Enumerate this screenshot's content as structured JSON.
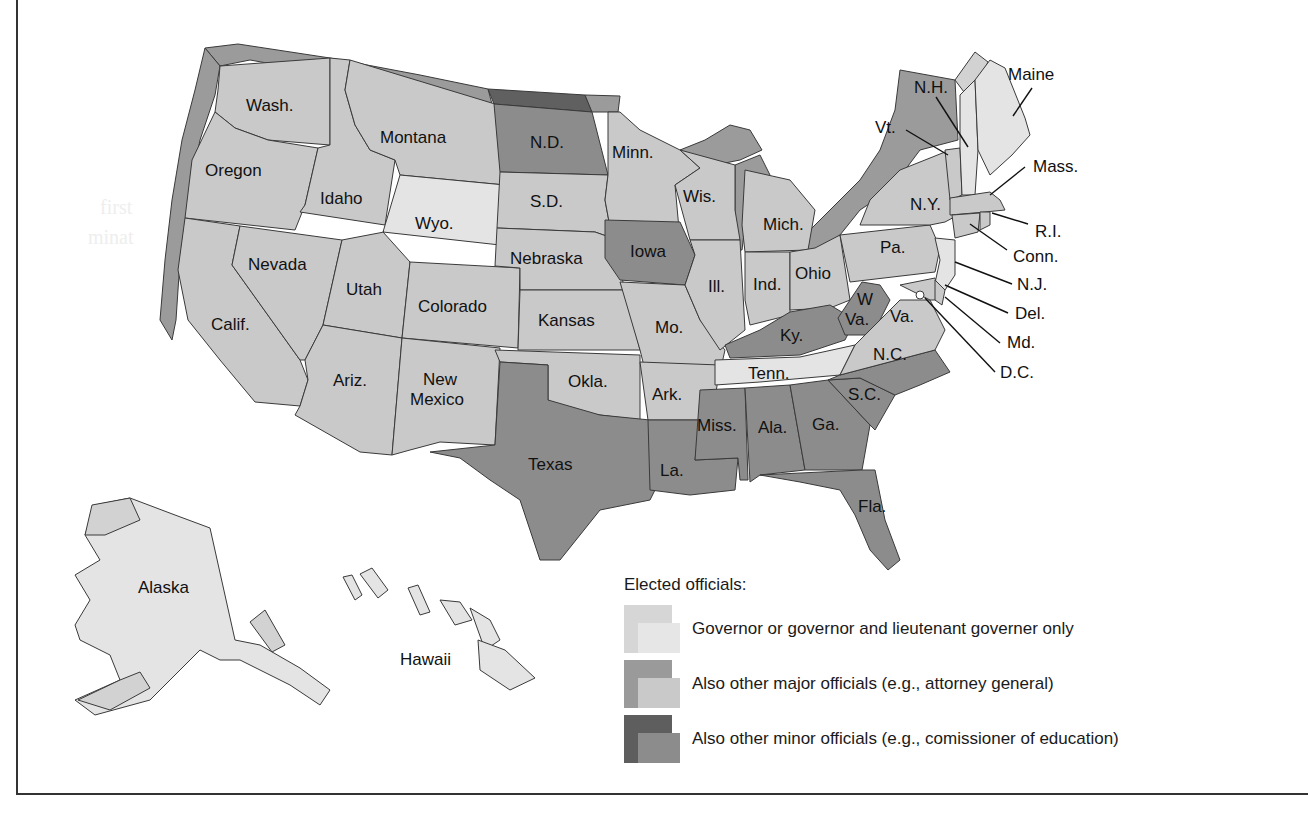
{
  "figure": {
    "colors": {
      "governor_only": "#e4e4e4",
      "major_officials": "#c9c9c9",
      "minor_officials": "#8c8c8c",
      "major_extrude": "#9b9b9b",
      "minor_extrude": "#606060",
      "frame": "#333333"
    }
  },
  "states": {
    "wash": "Wash.",
    "oregon": "Oregon",
    "calif": "Calif.",
    "nevada": "Nevada",
    "idaho": "Idaho",
    "montana": "Montana",
    "wyo": "Wyo.",
    "utah": "Utah",
    "colorado": "Colorado",
    "ariz": "Ariz.",
    "new_mexico_1": "New",
    "new_mexico_2": "Mexico",
    "nd": "N.D.",
    "sd": "S.D.",
    "nebraska": "Nebraska",
    "kansas": "Kansas",
    "okla": "Okla.",
    "texas": "Texas",
    "minn": "Minn.",
    "iowa": "Iowa",
    "mo": "Mo.",
    "ark": "Ark.",
    "la": "La.",
    "wis": "Wis.",
    "ill": "Ill.",
    "mich": "Mich.",
    "ind": "Ind.",
    "ohio": "Ohio",
    "ky": "Ky.",
    "tenn": "Tenn.",
    "miss": "Miss.",
    "ala": "Ala.",
    "ga": "Ga.",
    "fla": "Fla.",
    "sc": "S.C.",
    "nc": "N.C.",
    "va": "Va.",
    "wva_1": "W",
    "wva_2": "Va.",
    "pa": "Pa.",
    "ny": "N.Y.",
    "vt": "Vt.",
    "nh": "N.H.",
    "maine": "Maine",
    "mass": "Mass.",
    "ri": "R.I.",
    "conn": "Conn.",
    "nj": "N.J.",
    "del": "Del.",
    "md": "Md.",
    "dc": "D.C.",
    "alaska": "Alaska",
    "hawaii": "Hawaii"
  },
  "legend": {
    "title": "Elected officials:",
    "items": [
      {
        "label": "Governor or governor and lieutenant governer only",
        "level": "governor_only"
      },
      {
        "label": "Also other major officials (e.g., attorney general)",
        "level": "major_officials"
      },
      {
        "label": "Also other minor officials (e.g., comissioner of education)",
        "level": "minor_officials"
      }
    ]
  },
  "classification": {
    "governor_only": [
      "Wyo.",
      "Tenn.",
      "Maine",
      "N.H.",
      "N.J.",
      "Alaska",
      "Hawaii"
    ],
    "minor_officials": [
      "N.D.",
      "Iowa",
      "Texas",
      "La.",
      "Miss.",
      "Ala.",
      "Ga.",
      "Fla.",
      "S.C.",
      "N.C.",
      "Ky.",
      "W.Va."
    ],
    "major_officials": [
      "Wash.",
      "Oregon",
      "Calif.",
      "Nevada",
      "Idaho",
      "Montana",
      "Utah",
      "Colorado",
      "Ariz.",
      "New Mexico",
      "S.D.",
      "Nebraska",
      "Kansas",
      "Okla.",
      "Minn.",
      "Mo.",
      "Ark.",
      "Wis.",
      "Ill.",
      "Mich.",
      "Ind.",
      "Ohio",
      "Va.",
      "Pa.",
      "N.Y.",
      "Vt.",
      "Mass.",
      "R.I.",
      "Conn.",
      "Del.",
      "Md.",
      "D.C."
    ]
  },
  "ghost_text": [
    "first",
    "minat"
  ]
}
